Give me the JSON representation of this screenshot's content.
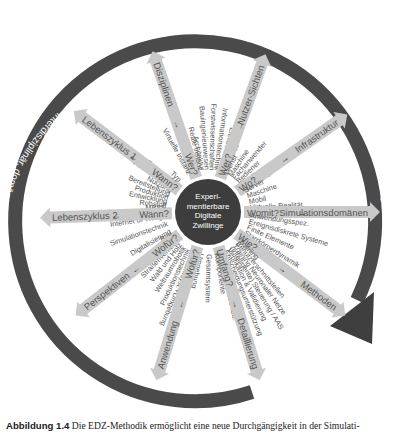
{
  "diagram": {
    "center": {
      "lines": [
        "Experi-",
        "mentierbare",
        "Digitale",
        "Zwillinge"
      ],
      "fill": "#3d3d3d",
      "text_color": "#ffffff"
    },
    "ring": {
      "fill": "#4a4a4a",
      "text_color": "#ffffff",
      "label_right": "Experimentierbare Digitale Zwillinge",
      "label_left": "interdisziplinär, domänen-, system-, prozess- und anwendungsübergreifend"
    },
    "spoke_color": "#c9c9c9",
    "spokes": [
      {
        "id": "disziplinen",
        "question": "Wer?",
        "arrow": "→",
        "label": "Disziplinen",
        "items": [
          "Architektur",
          "Bauingenieurwesen",
          "Forstwissenschaften",
          "Informationstechnik",
          "Elektrotechnik",
          "Mechanik"
        ]
      },
      {
        "id": "nutzer-sichten",
        "question": "Wer?",
        "arrow": "→",
        "label": "Nutzer-Sichten",
        "items": [
          "Dienst",
          "Maschine",
          "Fachanwender",
          "Bediener",
          "Monteur",
          "Entwickler"
        ]
      },
      {
        "id": "infrastruktur",
        "question": "Wo?",
        "arrow": "→",
        "label": "Infrastruktur",
        "items": [
          "Server",
          "Maschine",
          "Mobil",
          "Virtuelle Realität",
          "Desktop"
        ]
      },
      {
        "id": "simulationsdomaenen",
        "question": "Womit?",
        "arrow": "→",
        "label": "Simulationsdomänen",
        "items": [
          "Anwendungsspez.",
          "Ereignisdiskrete Systeme",
          "Finite Elemente",
          "Starrkörperdynamik",
          "Kinematik"
        ]
      },
      {
        "id": "methoden",
        "question": "Wie?",
        "arrow": "→",
        "label": "Methoden",
        "items": [
          "Training",
          "Benutzerschnittstellen",
          "Training Neuronaler Netze",
          "(Intelligente) Steuerung / AAS",
          "Verifikation & Validierung",
          "Entscheidungsunterstützung",
          "Systems Engineering",
          "Semant. Umweltmod."
        ]
      },
      {
        "id": "detaillierung",
        "question": "Umfang?",
        "arrow": "→",
        "label": "Detaillierung",
        "items": [
          "Komponente",
          "Gesamtsystem",
          "Umgebung",
          "Gesamtsyst.+Umgebung"
        ]
      },
      {
        "id": "anwendung",
        "question": "Wofür?",
        "arrow": "←",
        "label": "Anwendung",
        "items": [
          "Produktionstechnik",
          "Weltraumrobotik",
          "Wald und Holz",
          "Straßenverkehr",
          "Stadtplanung",
          "Bau"
        ]
      },
      {
        "id": "perspektiven",
        "question": "Wofür?",
        "arrow": "←",
        "label": "Perspektiven",
        "items": [
          "Digitalisierung",
          "Simulationstechnik",
          "Internet of Things",
          "MBSE"
        ]
      },
      {
        "id": "lebenszyklus-2",
        "question": "Wann?",
        "arrow": "←",
        "label": "Lebenszyklus 2",
        "items": [
          "Rohstoff",
          "Entwicklung",
          "Produktion",
          "Bereitstellung",
          "Nutzung",
          "Instandhaltung",
          "Entsorgung"
        ]
      },
      {
        "id": "lebenszyklus-1",
        "question": "Wann?",
        "arrow": "←",
        "label": "Lebenszyklus 1",
        "items": [
          "Typ",
          "Virtuelle Instanz",
          "Reale Instanz"
        ]
      }
    ]
  },
  "caption": {
    "label": "Abbildung 1.4",
    "text": "Die EDZ-Methodik ermöglicht eine neue Durchgängigkeit in der Simulati-"
  }
}
